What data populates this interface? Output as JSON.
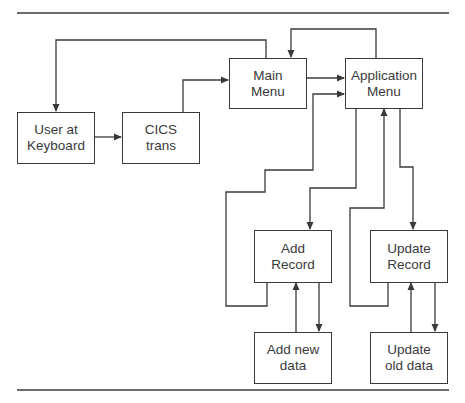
{
  "diagram": {
    "type": "flowchart",
    "line_color": "#3a3a3a",
    "nodes": {
      "user": {
        "line1": "User at",
        "line2": "Keyboard"
      },
      "cics": {
        "line1": "CICS",
        "line2": "trans"
      },
      "main_menu": {
        "line1": "Main",
        "line2": "Menu"
      },
      "app_menu": {
        "line1": "Application",
        "line2": "Menu"
      },
      "add_record": {
        "line1": "Add",
        "line2": "Record"
      },
      "update_record": {
        "line1": "Update",
        "line2": "Record"
      },
      "add_new_data": {
        "line1": "Add new",
        "line2": "data"
      },
      "update_old_data": {
        "line1": "Update",
        "line2": "old data"
      }
    },
    "edges": [
      {
        "from": "User at Keyboard",
        "to": "CICS trans"
      },
      {
        "from": "CICS trans",
        "to": "Main Menu"
      },
      {
        "from": "Main Menu",
        "to": "User at Keyboard"
      },
      {
        "from": "Main Menu",
        "to": "Application Menu"
      },
      {
        "from": "Application Menu",
        "to": "Main Menu"
      },
      {
        "from": "Application Menu",
        "to": "Add Record"
      },
      {
        "from": "Add Record",
        "to": "Application Menu"
      },
      {
        "from": "Application Menu",
        "to": "Update Record"
      },
      {
        "from": "Update Record",
        "to": "Application Menu"
      },
      {
        "from": "Add Record",
        "to": "Add new data"
      },
      {
        "from": "Add new data",
        "to": "Add Record"
      },
      {
        "from": "Update Record",
        "to": "Update old data"
      },
      {
        "from": "Update old data",
        "to": "Update Record"
      }
    ]
  }
}
